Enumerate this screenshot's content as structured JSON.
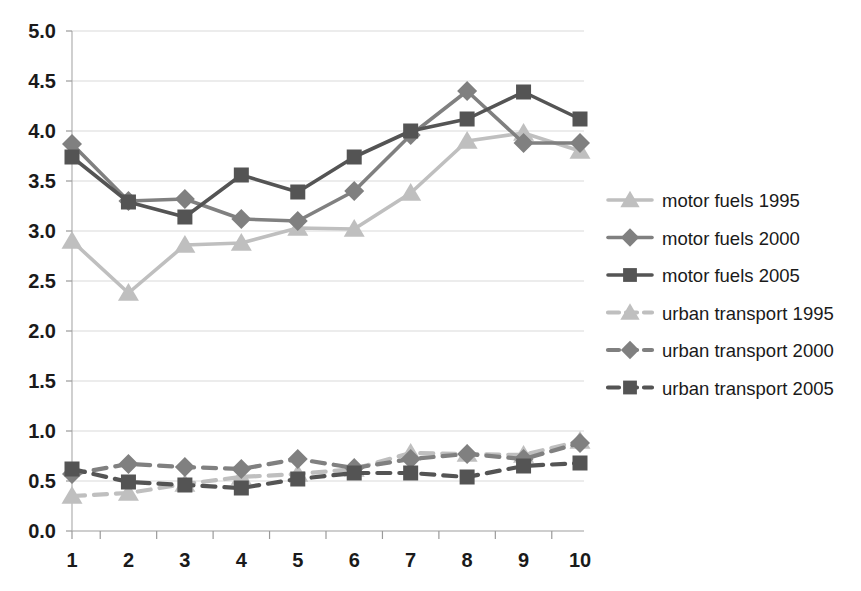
{
  "chart_data": {
    "type": "line",
    "title": "",
    "subtitle": "",
    "xlabel": "",
    "ylabel": "",
    "x": [
      1,
      2,
      3,
      4,
      5,
      6,
      7,
      8,
      9,
      10
    ],
    "categories": [
      "1",
      "2",
      "3",
      "4",
      "5",
      "6",
      "7",
      "8",
      "9",
      "10"
    ],
    "xtick_labels": [
      "1",
      "2",
      "3",
      "4",
      "5",
      "6",
      "7",
      "8",
      "9",
      "10"
    ],
    "ytick_labels": [
      "0.0",
      "0.5",
      "1.0",
      "1.5",
      "2.0",
      "2.5",
      "3.0",
      "3.5",
      "4.0",
      "4.5",
      "5.0"
    ],
    "ytick_values": [
      0.0,
      0.5,
      1.0,
      1.5,
      2.0,
      2.5,
      3.0,
      3.5,
      4.0,
      4.5,
      5.0
    ],
    "ylim": [
      0.0,
      5.0
    ],
    "xlim": [
      1,
      10
    ],
    "grid": true,
    "grid_axis": "y",
    "legend_position": "right",
    "series": [
      {
        "name": "motor fuels 1995",
        "marker": "triangle",
        "linestyle": "solid",
        "color": "#bfbfbf",
        "values": [
          2.9,
          2.38,
          2.86,
          2.88,
          3.03,
          3.02,
          3.38,
          3.9,
          3.98,
          3.8
        ]
      },
      {
        "name": "motor fuels 2000",
        "marker": "diamond",
        "linestyle": "solid",
        "color": "#808080",
        "values": [
          3.87,
          3.3,
          3.32,
          3.12,
          3.1,
          3.4,
          3.96,
          4.4,
          3.88,
          3.88
        ]
      },
      {
        "name": "motor fuels 2005",
        "marker": "square",
        "linestyle": "solid",
        "color": "#545454",
        "values": [
          3.74,
          3.29,
          3.14,
          3.56,
          3.39,
          3.74,
          4.0,
          4.12,
          4.39,
          4.12
        ]
      },
      {
        "name": "urban transport 1995",
        "marker": "triangle",
        "linestyle": "dashed",
        "color": "#bfbfbf",
        "values": [
          0.35,
          0.38,
          0.47,
          0.54,
          0.57,
          0.62,
          0.78,
          0.77,
          0.76,
          0.9
        ]
      },
      {
        "name": "urban transport 2000",
        "marker": "diamond",
        "linestyle": "dashed",
        "color": "#808080",
        "values": [
          0.57,
          0.67,
          0.64,
          0.62,
          0.72,
          0.63,
          0.72,
          0.77,
          0.72,
          0.88
        ]
      },
      {
        "name": "urban transport 2005",
        "marker": "square",
        "linestyle": "dashed",
        "color": "#545454",
        "values": [
          0.62,
          0.49,
          0.46,
          0.43,
          0.52,
          0.58,
          0.58,
          0.54,
          0.65,
          0.68
        ]
      }
    ]
  },
  "legend": {
    "entries": [
      {
        "label": "motor fuels 1995"
      },
      {
        "label": "motor fuels 2000"
      },
      {
        "label": "motor fuels 2005"
      },
      {
        "label": "urban transport 1995"
      },
      {
        "label": "urban transport 2000"
      },
      {
        "label": "urban transport 2005"
      }
    ]
  },
  "colors": {
    "light": "#bfbfbf",
    "medium": "#808080",
    "dark": "#545454",
    "gridline": "#d9d9d9",
    "axis": "#b0b0b0",
    "text": "#1a1a1a",
    "background": "#ffffff"
  }
}
